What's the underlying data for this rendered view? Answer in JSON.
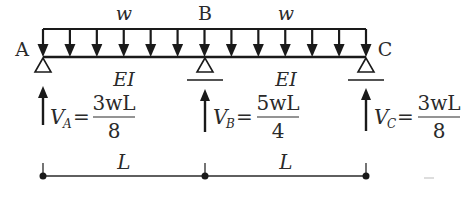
{
  "diagram": {
    "load_label": "w",
    "load_label_right": "w",
    "supports": [
      {
        "label": "A",
        "type": "pin",
        "x": 43
      },
      {
        "label": "B",
        "type": "roller",
        "x": 205
      },
      {
        "label": "C",
        "type": "roller",
        "x": 366
      }
    ],
    "stiffness_left": "EI",
    "stiffness_right": "EI",
    "reactions": [
      {
        "symbol": "V",
        "sub": "A",
        "eq": "=",
        "num": "3wL",
        "den": "8"
      },
      {
        "symbol": "V",
        "sub": "B",
        "eq": "=",
        "num": "5wL",
        "den": "4"
      },
      {
        "symbol": "V",
        "sub": "C",
        "eq": "=",
        "num": "3wL",
        "den": "8"
      }
    ],
    "spans": [
      {
        "label": "L"
      },
      {
        "label": "L"
      }
    ],
    "colors": {
      "ink": "#1a1a1a",
      "text": "#2a2a2a",
      "background": "#ffffff"
    }
  }
}
